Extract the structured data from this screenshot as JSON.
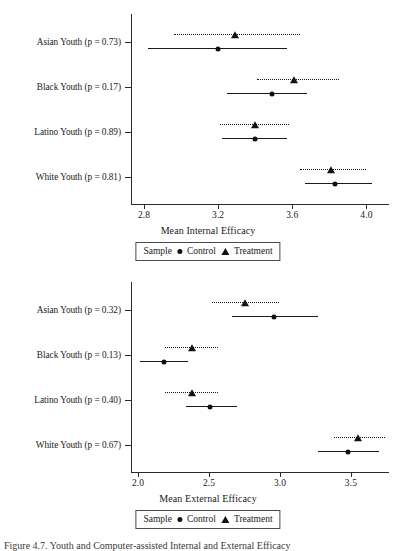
{
  "figure": {
    "caption": "Figure 4.7. Youth and Computer-assisted Internal and External Efficacy"
  },
  "legend": {
    "title": "Sample",
    "control_label": "Control",
    "treatment_label": "Treatment",
    "control_marker": "circle-marker",
    "treatment_marker": "triangle-marker"
  },
  "chart_data": [
    {
      "type": "scatter",
      "id": "internal-efficacy",
      "title": "",
      "xlabel": "Mean Internal Efficacy",
      "ylabel": "",
      "xlim": [
        2.73,
        4.1
      ],
      "xticks": [
        2.8,
        3.2,
        3.6,
        4.0
      ],
      "xtick_labels": [
        "2.8",
        "3.2",
        "3.6",
        "4.0"
      ],
      "grid": false,
      "legend_position": "bottom",
      "categories": [
        "Asian Youth (p = 0.73)",
        "Black Youth (p = 0.17)",
        "Latino Youth (p = 0.89)",
        "White Youth (p = 0.81)"
      ],
      "series": [
        {
          "name": "Control",
          "marker": "circle",
          "line_style": "solid",
          "values": [
            3.2,
            3.49,
            3.4,
            3.83
          ],
          "ci_low": [
            2.82,
            3.25,
            3.22,
            3.67
          ],
          "ci_high": [
            3.57,
            3.68,
            3.57,
            4.03
          ]
        },
        {
          "name": "Treatment",
          "marker": "triangle",
          "line_style": "dotted",
          "values": [
            3.29,
            3.61,
            3.4,
            3.81
          ],
          "ci_low": [
            2.96,
            3.41,
            3.21,
            3.64
          ],
          "ci_high": [
            3.64,
            3.85,
            3.58,
            4.0
          ]
        }
      ]
    },
    {
      "type": "scatter",
      "id": "external-efficacy",
      "title": "",
      "xlabel": "Mean External Efficacy",
      "ylabel": "",
      "xlim": [
        1.95,
        3.74
      ],
      "xticks": [
        2.0,
        2.5,
        3.0,
        3.5
      ],
      "xtick_labels": [
        "2.0",
        "2.5",
        "3.0",
        "3.5"
      ],
      "grid": false,
      "legend_position": "bottom",
      "categories": [
        "Asian Youth (p = 0.32)",
        "Black Youth (p = 0.13)",
        "Latino Youth (p = 0.40)",
        "White Youth (p = 0.67)"
      ],
      "series": [
        {
          "name": "Control",
          "marker": "circle",
          "line_style": "solid",
          "values": [
            2.96,
            2.18,
            2.51,
            3.48
          ],
          "ci_low": [
            2.66,
            2.01,
            2.34,
            3.27
          ],
          "ci_high": [
            3.27,
            2.35,
            2.7,
            3.7
          ]
        },
        {
          "name": "Treatment",
          "marker": "triangle",
          "line_style": "dotted",
          "values": [
            2.75,
            2.38,
            2.38,
            3.55
          ],
          "ci_low": [
            2.52,
            2.19,
            2.19,
            3.38
          ],
          "ci_high": [
            2.99,
            2.56,
            2.56,
            3.74
          ]
        }
      ]
    }
  ]
}
